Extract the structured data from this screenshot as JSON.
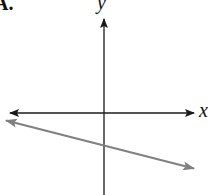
{
  "figure": {
    "choice_label": "A.",
    "x_axis_label": "x",
    "y_axis_label": "y",
    "colors": {
      "axes": "#1a1a1a",
      "line": "#808080"
    }
  }
}
